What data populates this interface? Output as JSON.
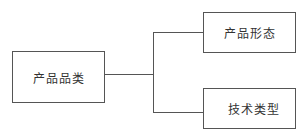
{
  "diagram": {
    "type": "tree",
    "root": {
      "label": "产品品类"
    },
    "children": [
      {
        "label": "产品形态"
      },
      {
        "label": "技术类型"
      }
    ],
    "colors": {
      "stroke": "#555555",
      "text": "#333333",
      "background": "#ffffff"
    }
  }
}
